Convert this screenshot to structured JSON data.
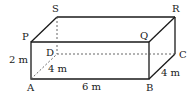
{
  "diagram": {
    "type": "cuboid",
    "vertices": {
      "A": {
        "label": "A",
        "x": 31,
        "y": 79
      },
      "B": {
        "label": "B",
        "x": 149,
        "y": 79
      },
      "C": {
        "label": "C",
        "x": 175,
        "y": 54
      },
      "D": {
        "label": "D",
        "x": 57,
        "y": 54
      },
      "P": {
        "label": "P",
        "x": 31,
        "y": 42
      },
      "Q": {
        "label": "Q",
        "x": 149,
        "y": 42
      },
      "R": {
        "label": "R",
        "x": 175,
        "y": 17
      },
      "S": {
        "label": "S",
        "x": 57,
        "y": 17
      }
    },
    "dimensions": {
      "height": "2 m",
      "length": "6 m",
      "width_right": "4 m",
      "width_diagonal": "4 m"
    },
    "colors": {
      "line": "#1a1a1a",
      "hidden_line": "#555555",
      "background": "#ffffff"
    }
  }
}
